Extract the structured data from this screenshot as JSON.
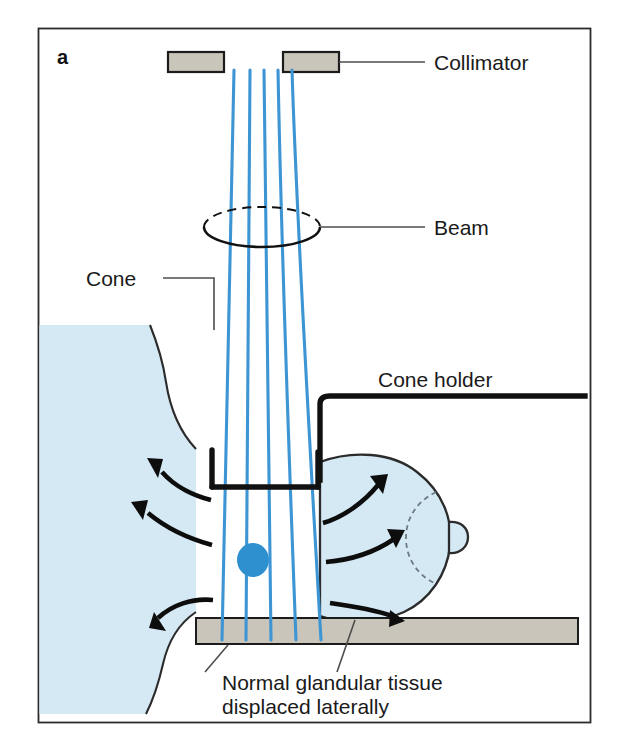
{
  "figure": {
    "panel_label": "a",
    "accent_beam_color": "#3d95d3",
    "tissue_color": "#d5e9f5",
    "metal_color": "#c9c5bb",
    "tumor_color": "#2e90cf",
    "outline_color": "#111111"
  },
  "labels": {
    "collimator": "Collimator",
    "beam": "Beam",
    "cone": "Cone",
    "cone_holder": "Cone holder",
    "caption_line1": "Normal glandular tissue",
    "caption_line2": "displaced laterally"
  },
  "diagram_parts": {
    "collimator_bar_left": "collimator-bar-left",
    "collimator_bar_right": "collimator-bar-right",
    "beam_lines_count": 5,
    "beam_circle": "beam-cross-section-ellipse",
    "cone": "compression-cone",
    "cone_holder": "cone-holder-bracket",
    "breast_tissue": "breast-tissue-field",
    "breast_mass": "breast-lateral-mass",
    "nipple": "nipple",
    "areola": "areola-dashed-arc",
    "tumor": "tumor-blob",
    "base_plate": "detector-base-plate",
    "displacement_arrows_count": 6
  }
}
